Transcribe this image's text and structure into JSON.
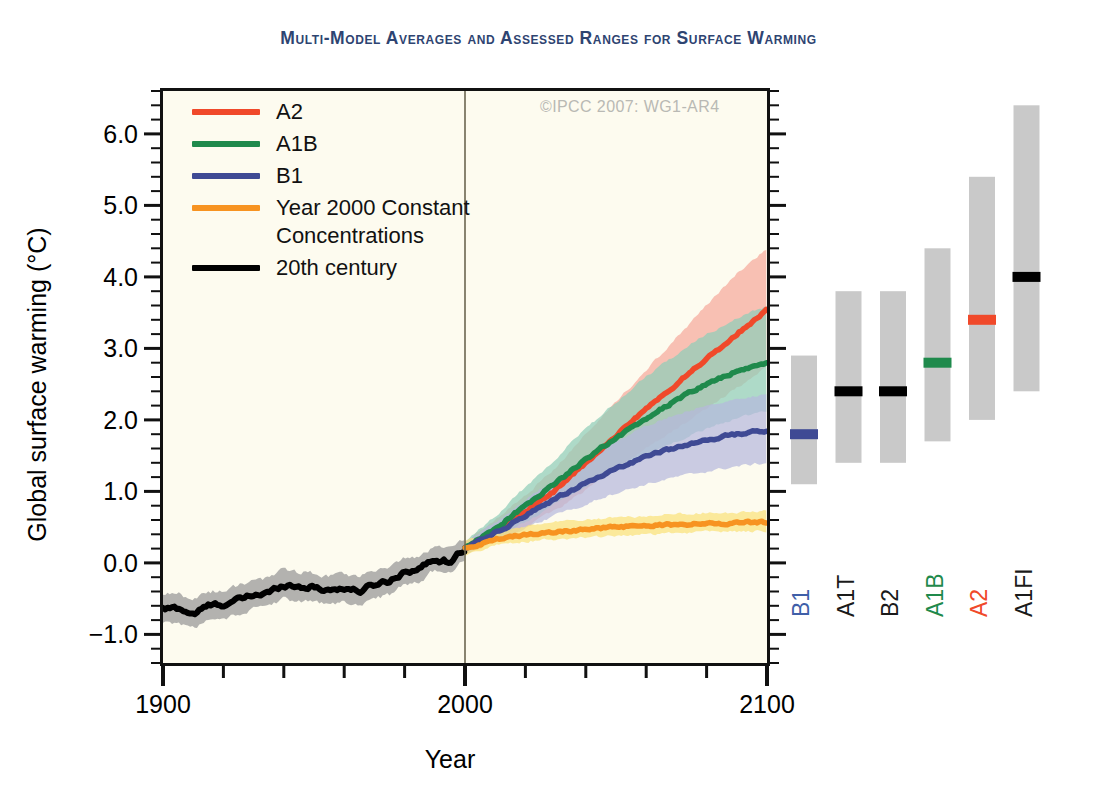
{
  "title": "Multi-Model Averages and Assessed Ranges for Surface Warming",
  "copyright": "©IPCC  2007: WG1-AR4",
  "axes": {
    "xlabel": "Year",
    "ylabel": "Global surface warming (°C)",
    "xticks": [
      "1900",
      "2000",
      "2100"
    ],
    "yticks": [
      "6.0",
      "5.0",
      "4.0",
      "3.0",
      "2.0",
      "1.0",
      "0.0",
      "−1.0"
    ]
  },
  "legend": [
    {
      "label": "A2",
      "color": "#f0492a"
    },
    {
      "label": "A1B",
      "color": "#1f8a4c"
    },
    {
      "label": "B1",
      "color": "#3f4a94"
    },
    {
      "label": "Year 2000 Constant\nConcentrations",
      "color": "#f79321"
    },
    {
      "label": "20th century",
      "color": "#000000"
    }
  ],
  "chart_data": {
    "type": "line",
    "title": "Multi-Model Averages and Assessed Ranges for Surface Warming",
    "xlabel": "Year",
    "ylabel": "Global surface warming (°C)",
    "xlim": [
      1900,
      2100
    ],
    "ylim": [
      -1.4,
      6.6
    ],
    "xticks": [
      1900,
      2000,
      2100
    ],
    "xminor_step": 20,
    "yticks": [
      -1,
      0,
      1,
      2,
      3,
      4,
      5,
      6
    ],
    "yminor_step": 0.2,
    "grid": false,
    "legend_position": "top-left",
    "plot_bgcolor": "#fdfbef",
    "series": [
      {
        "name": "20th century",
        "color": "#000000",
        "band_color": "#9a9a9a",
        "x": [
          1900,
          1905,
          1910,
          1915,
          1920,
          1925,
          1930,
          1935,
          1940,
          1945,
          1950,
          1955,
          1960,
          1965,
          1970,
          1975,
          1980,
          1985,
          1990,
          1995,
          2000
        ],
        "values": [
          -0.65,
          -0.63,
          -0.72,
          -0.6,
          -0.58,
          -0.52,
          -0.45,
          -0.42,
          -0.3,
          -0.33,
          -0.34,
          -0.38,
          -0.35,
          -0.4,
          -0.3,
          -0.25,
          -0.12,
          -0.08,
          0.05,
          0.02,
          0.2
        ],
        "band_lower": [
          -0.85,
          -0.83,
          -0.92,
          -0.8,
          -0.78,
          -0.72,
          -0.65,
          -0.62,
          -0.5,
          -0.53,
          -0.54,
          -0.58,
          -0.55,
          -0.6,
          -0.5,
          -0.45,
          -0.3,
          -0.26,
          -0.1,
          -0.13,
          0.08
        ],
        "band_upper": [
          -0.45,
          -0.43,
          -0.52,
          -0.4,
          -0.38,
          -0.32,
          -0.25,
          -0.22,
          -0.1,
          -0.13,
          -0.14,
          -0.18,
          -0.15,
          -0.2,
          -0.1,
          -0.05,
          0.06,
          0.1,
          0.22,
          0.19,
          0.32
        ]
      },
      {
        "name": "A2",
        "color": "#f0492a",
        "band_color": "#f5a99b",
        "x": [
          2000,
          2010,
          2020,
          2030,
          2040,
          2050,
          2060,
          2070,
          2080,
          2090,
          2100
        ],
        "values": [
          0.2,
          0.45,
          0.72,
          1.02,
          1.4,
          1.78,
          2.15,
          2.5,
          2.85,
          3.2,
          3.55
        ],
        "band_lower": [
          0.12,
          0.3,
          0.5,
          0.74,
          1.02,
          1.32,
          1.6,
          1.88,
          2.15,
          2.45,
          2.75
        ],
        "band_upper": [
          0.3,
          0.6,
          0.95,
          1.32,
          1.8,
          2.25,
          2.7,
          3.15,
          3.6,
          4.05,
          4.4
        ]
      },
      {
        "name": "A1B",
        "color": "#1f8a4c",
        "band_color": "#8fcdb9",
        "x": [
          2000,
          2010,
          2020,
          2030,
          2040,
          2050,
          2060,
          2070,
          2080,
          2090,
          2100
        ],
        "values": [
          0.2,
          0.48,
          0.8,
          1.12,
          1.45,
          1.75,
          2.02,
          2.28,
          2.5,
          2.68,
          2.8
        ],
        "band_lower": [
          0.12,
          0.33,
          0.57,
          0.82,
          1.07,
          1.3,
          1.5,
          1.7,
          1.88,
          2.02,
          2.12
        ],
        "band_upper": [
          0.3,
          0.65,
          1.06,
          1.46,
          1.88,
          2.25,
          2.6,
          2.92,
          3.2,
          3.42,
          3.6
        ]
      },
      {
        "name": "B1",
        "color": "#3f4a94",
        "band_color": "#b6b8dd",
        "x": [
          2000,
          2010,
          2020,
          2030,
          2040,
          2050,
          2060,
          2070,
          2080,
          2090,
          2100
        ],
        "values": [
          0.2,
          0.42,
          0.66,
          0.9,
          1.12,
          1.32,
          1.48,
          1.62,
          1.72,
          1.8,
          1.85
        ],
        "band_lower": [
          0.12,
          0.3,
          0.48,
          0.66,
          0.83,
          0.98,
          1.1,
          1.2,
          1.28,
          1.35,
          1.4
        ],
        "band_upper": [
          0.3,
          0.56,
          0.88,
          1.18,
          1.45,
          1.7,
          1.92,
          2.08,
          2.2,
          2.3,
          2.35
        ]
      },
      {
        "name": "Year 2000 Constant Concentrations",
        "color": "#f79321",
        "band_color": "#f9e27a",
        "x": [
          2000,
          2010,
          2020,
          2030,
          2040,
          2050,
          2060,
          2070,
          2080,
          2090,
          2100
        ],
        "values": [
          0.2,
          0.33,
          0.4,
          0.44,
          0.47,
          0.5,
          0.52,
          0.54,
          0.55,
          0.56,
          0.57
        ],
        "band_lower": [
          0.12,
          0.24,
          0.3,
          0.33,
          0.36,
          0.38,
          0.4,
          0.42,
          0.43,
          0.44,
          0.45
        ],
        "band_upper": [
          0.3,
          0.44,
          0.52,
          0.57,
          0.6,
          0.63,
          0.66,
          0.68,
          0.7,
          0.71,
          0.72
        ]
      }
    ],
    "vline_year": 2000,
    "ranges_panel": {
      "ylabel_shared": true,
      "bar_color": "#c9c9c9",
      "bars": [
        {
          "name": "B1",
          "low": 1.1,
          "high": 2.9,
          "best": 1.8,
          "marker_color": "#3f4a94",
          "label_color": "#3f5fa8"
        },
        {
          "name": "A1T",
          "low": 1.4,
          "high": 3.8,
          "best": 2.4,
          "marker_color": "#000000",
          "label_color": "#1a1a1a"
        },
        {
          "name": "B2",
          "low": 1.4,
          "high": 3.8,
          "best": 2.4,
          "marker_color": "#000000",
          "label_color": "#1a1a1a"
        },
        {
          "name": "A1B",
          "low": 1.7,
          "high": 4.4,
          "best": 2.8,
          "marker_color": "#1f8a4c",
          "label_color": "#1f8a4c"
        },
        {
          "name": "A2",
          "low": 2.0,
          "high": 5.4,
          "best": 3.4,
          "marker_color": "#f0492a",
          "label_color": "#f0492a"
        },
        {
          "name": "A1FI",
          "low": 2.4,
          "high": 6.4,
          "best": 4.0,
          "marker_color": "#000000",
          "label_color": "#1a1a1a"
        }
      ]
    }
  }
}
